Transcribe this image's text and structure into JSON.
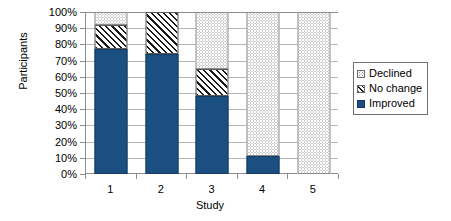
{
  "chart_data": {
    "type": "bar",
    "subtype": "stacked-percent",
    "title": "",
    "xlabel": "Study",
    "ylabel": "Participants",
    "categories": [
      "1",
      "2",
      "3",
      "4",
      "5"
    ],
    "ylim": [
      0,
      100
    ],
    "yticks": [
      "0%",
      "10%",
      "20%",
      "30%",
      "40%",
      "50%",
      "60%",
      "70%",
      "80%",
      "90%",
      "100%"
    ],
    "ytick_values": [
      0,
      10,
      20,
      30,
      40,
      50,
      60,
      70,
      80,
      90,
      100
    ],
    "grid": true,
    "legend_position": "right",
    "series": [
      {
        "name": "Improved",
        "color": "#1b4f82",
        "pattern": "solid",
        "values": [
          77,
          74,
          48,
          11,
          0
        ]
      },
      {
        "name": "No change",
        "color": "#1a1a1a",
        "pattern": "diagonal-hatch",
        "values": [
          15,
          26,
          17,
          0,
          0
        ]
      },
      {
        "name": "Declined",
        "color": "#9a9a9a",
        "pattern": "dotted",
        "values": [
          8,
          0,
          35,
          89,
          100
        ]
      }
    ]
  },
  "legend": {
    "items": [
      {
        "label": "Declined",
        "series": "Declined"
      },
      {
        "label": "No change",
        "series": "No change"
      },
      {
        "label": "Improved",
        "series": "Improved"
      }
    ]
  },
  "colors": {
    "improved": "#1b4f82",
    "no_change": "#1a1a1a",
    "declined": "#9a9a9a",
    "axis": "#8c8c8c",
    "grid": "#b6b6b6",
    "background": "#ffffff"
  }
}
